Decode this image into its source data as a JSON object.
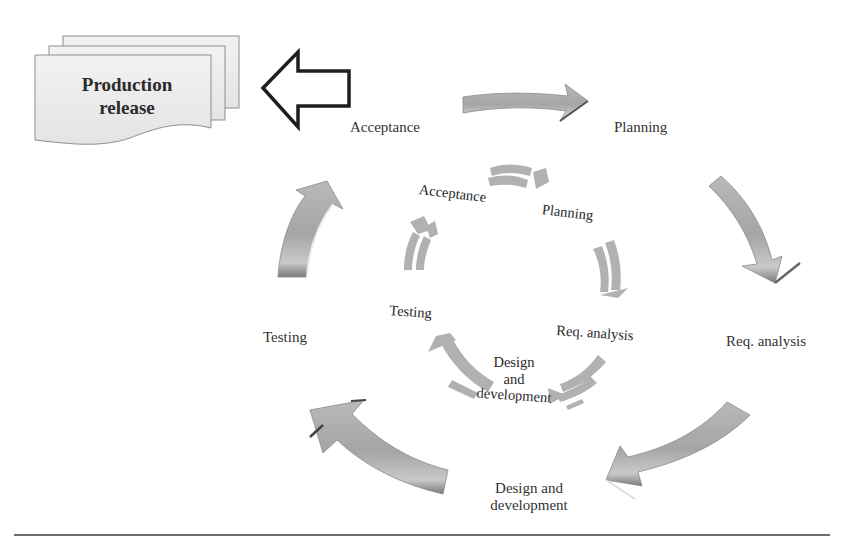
{
  "diagram": {
    "type": "iterative-cycle",
    "release_document": {
      "line1": "Production",
      "line2": "release"
    },
    "release_arrow_icon": "hollow-left-arrow",
    "outer_cycle": {
      "stages": [
        {
          "id": "acceptance",
          "label": "Acceptance"
        },
        {
          "id": "planning",
          "label": "Planning"
        },
        {
          "id": "req-analysis",
          "label": "Req. analysis"
        },
        {
          "id": "design-development",
          "line1": "Design and",
          "line2": "development"
        },
        {
          "id": "testing",
          "label": "Testing"
        }
      ]
    },
    "inner_cycle": {
      "stages": [
        {
          "id": "acceptance",
          "label": "Acceptance"
        },
        {
          "id": "planning",
          "label": "Planning"
        },
        {
          "id": "req-analysis",
          "label": "Req. analysis"
        },
        {
          "id": "design-development",
          "line1": "Design",
          "line2": "and",
          "line3": "development"
        },
        {
          "id": "testing",
          "label": "Testing"
        }
      ]
    },
    "colors": {
      "arrow_fill": "#a8a8a8",
      "arrow_highlight": "#d8d8d8",
      "arrow_shadow": "#6a6a6a",
      "document_fill": "#ececec",
      "document_stroke": "#8a8a8a",
      "rule": "#6e6e6e"
    }
  }
}
